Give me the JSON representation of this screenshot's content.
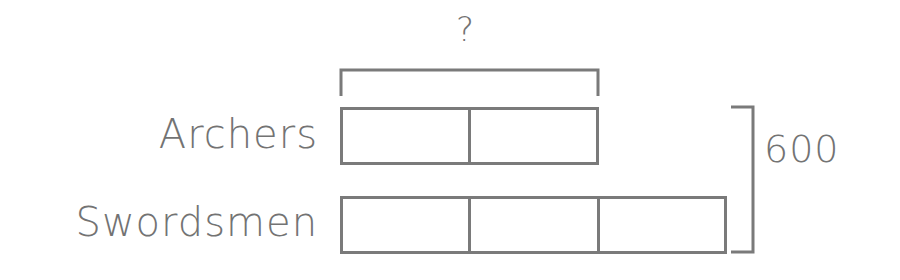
{
  "diagram": {
    "type": "tape-diagram",
    "question_mark": "?",
    "total_label": "600",
    "rows": [
      {
        "label": "Archers",
        "units": 2
      },
      {
        "label": "Swordsmen",
        "units": 3
      }
    ],
    "unknown_bracket_covers": "Archers",
    "total_bracket_covers": [
      "Archers",
      "Swordsmen"
    ],
    "colors": {
      "stroke": "#7a7a7a",
      "text": "#737373",
      "background": "#ffffff"
    }
  }
}
